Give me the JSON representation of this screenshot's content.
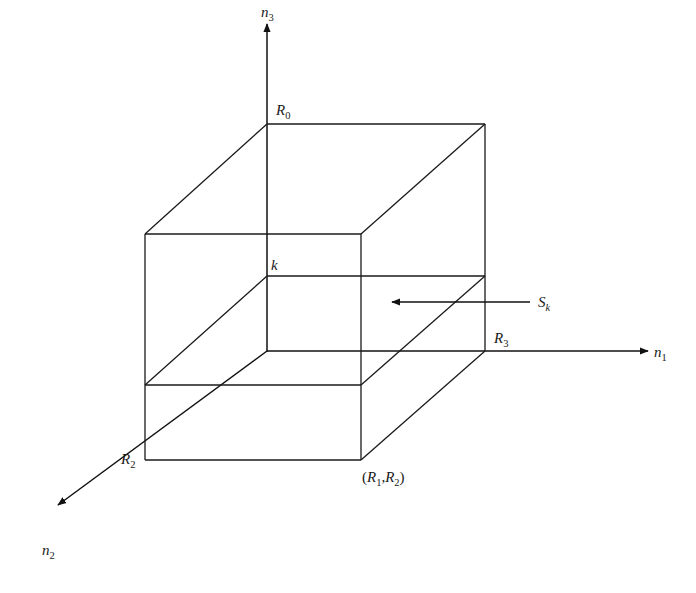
{
  "diagram": {
    "type": "3d-coordinate-cube",
    "colors": {
      "stroke": "#1a1a1a",
      "background": "#ffffff"
    },
    "axes": [
      {
        "id": "n1",
        "label": "n",
        "subscript": "1",
        "direction": "right"
      },
      {
        "id": "n2",
        "label": "n",
        "subscript": "2",
        "direction": "down-left"
      },
      {
        "id": "n3",
        "label": "n",
        "subscript": "3",
        "direction": "up"
      }
    ],
    "points": {
      "R0": {
        "label": "R",
        "subscript": "0"
      },
      "R2": {
        "label": "R",
        "subscript": "2"
      },
      "R3": {
        "label": "R",
        "subscript": "3"
      },
      "k": {
        "label": "k"
      },
      "R1R2": {
        "open": "(",
        "a": "R",
        "a_sub": "1",
        "comma": ",",
        "b": "R",
        "b_sub": "2",
        "close": ")"
      }
    },
    "slice": {
      "label": "S",
      "subscript": "k",
      "arrow": "points-left-into-cube"
    }
  }
}
